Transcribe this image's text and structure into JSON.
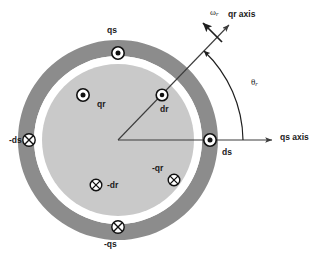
{
  "figure": {
    "background_color": "#ffffff",
    "stator_ring_color": "#8c8c8c",
    "airgap_color": "#ffffff",
    "rotor_color": "#c9c9c9",
    "line_color": "#3c3c3c",
    "text_color": "#1a1a1a"
  },
  "geometry": {
    "center_x": 118,
    "center_y": 140,
    "stator_outer_radius": 100,
    "stator_inner_radius": 84,
    "rotor_radius": 76,
    "qs_axis_angle_deg": 0,
    "qr_axis_angle_deg": 56,
    "theta_r_arc_radius": 85
  },
  "axes": {
    "qs": {
      "label": "qs axis",
      "x": 281,
      "y": 135
    },
    "qr": {
      "label": "qr axis",
      "x": 230,
      "y": 12
    },
    "omega": {
      "label": "ω",
      "sub": "r",
      "x": 212,
      "y": 11
    },
    "theta": {
      "label": "θ",
      "sub": "r",
      "x": 253,
      "y": 81
    }
  },
  "windings": [
    {
      "name": "qs",
      "label": "qs",
      "marker": "dot",
      "label_x": 107,
      "label_y": 29,
      "marker_x": 118,
      "marker_y": 53
    },
    {
      "name": "-qs",
      "label": "-qs",
      "marker": "cross",
      "label_x": 104,
      "label_y": 243,
      "marker_x": 118,
      "marker_y": 227
    },
    {
      "name": "ds",
      "label": "ds",
      "marker": "dot",
      "label_x": 224,
      "label_y": 152,
      "marker_x": 210,
      "marker_y": 140
    },
    {
      "name": "-ds",
      "label": "-ds",
      "marker": "cross",
      "label_x": 12,
      "label_y": 144,
      "marker_x": 29,
      "marker_y": 140
    },
    {
      "name": "qr",
      "label": "qr",
      "marker": "dot",
      "label_x": 100,
      "label_y": 104,
      "marker_x": 83,
      "marker_y": 95
    },
    {
      "name": "-qr",
      "label": "-qr",
      "marker": "cross",
      "label_x": 153,
      "label_y": 168,
      "marker_x": 174,
      "marker_y": 180
    },
    {
      "name": "dr",
      "label": "dr",
      "marker": "dot",
      "label_x": 164,
      "label_y": 109,
      "marker_x": 162,
      "marker_y": 95
    },
    {
      "name": "-dr",
      "label": "-dr",
      "marker": "cross",
      "label_x": 110,
      "label_y": 187,
      "marker_x": 96,
      "marker_y": 185
    }
  ]
}
